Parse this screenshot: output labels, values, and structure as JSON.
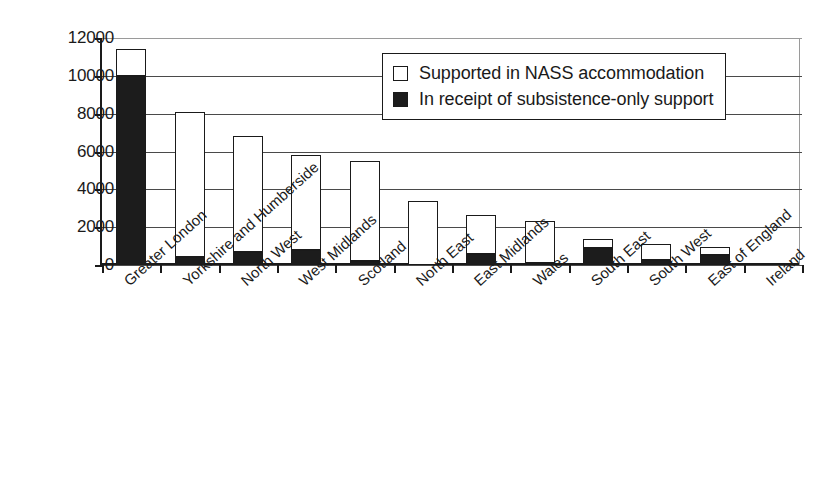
{
  "chart_data": {
    "type": "bar",
    "subtype": "stacked",
    "title": "",
    "subtitle": "",
    "xlabel": "",
    "ylabel": "",
    "ylim": [
      0,
      12000
    ],
    "ytick_values": [
      0,
      2000,
      4000,
      6000,
      8000,
      10000,
      12000
    ],
    "ytick_labels": [
      "0",
      "2000",
      "4000",
      "6000",
      "8000",
      "10000",
      "12000"
    ],
    "grid": true,
    "grid_axis": "y",
    "legend_position": "top-right",
    "categories": [
      "Greater London",
      "Yorkshire and Humberside",
      "North West",
      "West Midlands",
      "Scotland",
      "North East",
      "East Midlands",
      "Wales",
      "South East",
      "South West",
      "East of England",
      "Ireland"
    ],
    "series": [
      {
        "name": "In receipt of subsistence-only support",
        "color": "#1c1c1c",
        "swatch": "filled",
        "values": [
          10000,
          400,
          700,
          800,
          200,
          0,
          600,
          100,
          900,
          250,
          550,
          0
        ]
      },
      {
        "name": "Supported in NASS accommodation",
        "color": "#ffffff",
        "swatch": "open",
        "values": [
          1400,
          7700,
          6100,
          5000,
          5300,
          3400,
          2050,
          2250,
          500,
          850,
          400,
          100
        ]
      }
    ],
    "totals": [
      11400,
      8100,
      6800,
      5800,
      5500,
      3400,
      2650,
      2350,
      1400,
      1100,
      950,
      100
    ]
  },
  "legend": {
    "items": [
      {
        "label": "Supported in NASS accommodation",
        "swatch": "open"
      },
      {
        "label": "In receipt of subsistence-only support",
        "swatch": "filled"
      }
    ]
  },
  "colors": {
    "axis": "#1a1a1a",
    "grid": "#4a4a4a",
    "bar_fill_supported": "#ffffff",
    "bar_fill_subsistence": "#1c1c1c",
    "bar_outline": "#1a1a1a",
    "background": "#ffffff"
  }
}
